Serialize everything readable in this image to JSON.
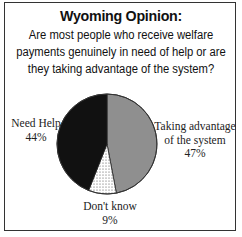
{
  "header": {
    "title": "Wyoming Opinion:",
    "question_lines": [
      "Are most  people who receive welfare",
      "payments genuinely in need of help or are",
      "they taking advantage of the system?"
    ]
  },
  "labels": {
    "need_help": {
      "name": "Need Help",
      "value": "44%"
    },
    "taking_advantage": {
      "name_lines": [
        "Taking advantage",
        "of the system"
      ],
      "value": "47%"
    },
    "dont_know": {
      "name": "Don't know",
      "value": "9%"
    }
  },
  "colors": {
    "taking_advantage": "#8f8f8f",
    "need_help": "#111111",
    "dont_know": "#ffffff",
    "border": "#333333"
  },
  "chart_data": {
    "type": "pie",
    "title": "Wyoming Opinion:",
    "subtitle": "Are most people who receive welfare payments genuinely in need of help or are they taking advantage of the system?",
    "categories": [
      "Taking advantage of the system",
      "Don't know",
      "Need Help"
    ],
    "values": [
      47,
      9,
      44
    ],
    "unit": "%",
    "start_angle": "12 o'clock",
    "direction": "clockwise",
    "legend": "none (direct labels)"
  }
}
